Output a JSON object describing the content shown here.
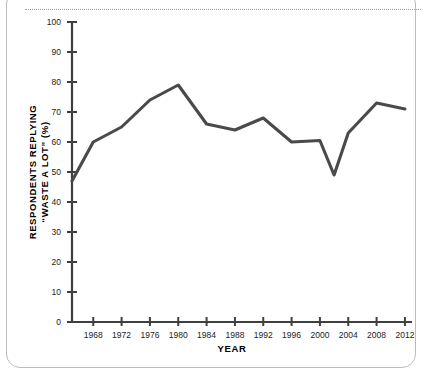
{
  "figure": {
    "card_label": "chart-card",
    "divider_label": "dotted-rule"
  },
  "chart_data": {
    "type": "line",
    "title": "",
    "xlabel": "YEAR",
    "ylabel_line1": "RESPONDENTS REPLYING",
    "ylabel_line2": "“WASTE A LOT” (%)",
    "xlim": [
      1965,
      2013
    ],
    "ylim": [
      0,
      100
    ],
    "grid": false,
    "legend": "none",
    "line_color": "#4a4a4a",
    "axis_color": "#3f3f3f",
    "xticks": [
      1968,
      1972,
      1976,
      1980,
      1984,
      1988,
      1992,
      1996,
      2000,
      2004,
      2008,
      2012
    ],
    "xtick_labels": [
      "1968",
      "1972",
      "1976",
      "1980",
      "1984",
      "1988",
      "1992",
      "1996",
      "2000",
      "2004",
      "2008",
      "2012"
    ],
    "yticks": [
      0,
      10,
      20,
      30,
      40,
      50,
      60,
      70,
      80,
      90,
      100
    ],
    "ytick_labels": [
      "0",
      "10",
      "20",
      "30",
      "40",
      "50",
      "60",
      "70",
      "80",
      "90",
      "100"
    ],
    "series": [
      {
        "name": "Waste a lot",
        "x": [
          1965,
          1968,
          1972,
          1976,
          1980,
          1984,
          1988,
          1992,
          1996,
          2000,
          2002,
          2004,
          2008,
          2012
        ],
        "values": [
          47,
          60,
          65,
          74,
          79,
          66,
          64,
          68,
          60,
          60.5,
          49,
          63,
          73,
          71
        ]
      }
    ]
  }
}
